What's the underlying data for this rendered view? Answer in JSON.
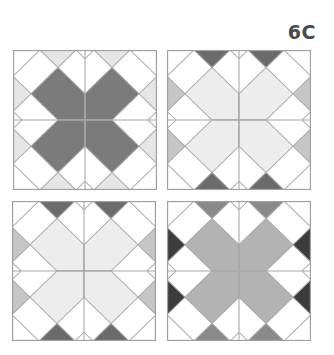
{
  "label": "6C",
  "blocks": [
    {
      "id": "b1",
      "name": "block-dark-x",
      "colors": {
        "x": "#7b7b7b",
        "tb": "#e6e6e6",
        "side": "#e6e6e6"
      }
    },
    {
      "id": "b2",
      "name": "block-light-x-dark-top-bottom",
      "colors": {
        "x": "#ededed",
        "tb": "#6b6b6b",
        "side": "#c6c6c6"
      }
    },
    {
      "id": "b3",
      "name": "block-light-x-dark-top-bottom-alt",
      "colors": {
        "x": "#ededed",
        "tb": "#6b6b6b",
        "side": "#c6c6c6"
      }
    },
    {
      "id": "b4",
      "name": "block-medium-x-black-sides",
      "colors": {
        "x": "#b3b3b3",
        "tb": "#8a8a8a",
        "side": "#3c3c3c"
      }
    }
  ],
  "line_color": "#a8a8a8",
  "border_color": "#a0a0a0"
}
